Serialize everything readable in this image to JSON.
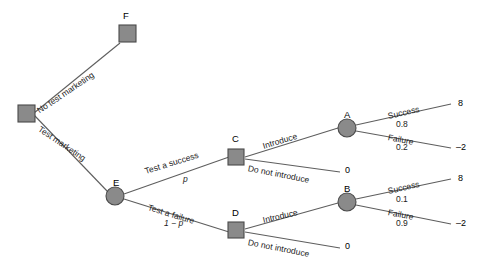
{
  "diagram": {
    "colors": {
      "node_fill": "#8a8a8a",
      "node_stroke": "#4a4a4a",
      "line": "#5e5e5e",
      "text": "#1c1c1c",
      "background": "#ffffff"
    },
    "nodes": [
      {
        "id": "root",
        "label": "",
        "shape": "square"
      },
      {
        "id": "F",
        "label": "F",
        "shape": "square"
      },
      {
        "id": "E",
        "label": "E",
        "shape": "circle"
      },
      {
        "id": "C",
        "label": "C",
        "shape": "square"
      },
      {
        "id": "D",
        "label": "D",
        "shape": "square"
      },
      {
        "id": "A",
        "label": "A",
        "shape": "circle"
      },
      {
        "id": "B",
        "label": "B",
        "shape": "circle"
      }
    ],
    "branches": [
      {
        "id": "no-test-marketing",
        "label": "No test marketing",
        "probability": ""
      },
      {
        "id": "test-marketing",
        "label": "Test marketing",
        "probability": ""
      },
      {
        "id": "test-a-success",
        "label": "Test a success",
        "probability": "p"
      },
      {
        "id": "test-a-failure",
        "label": "Test a failure",
        "probability": "1 − p"
      },
      {
        "id": "introduce-c",
        "label": "Introduce",
        "probability": ""
      },
      {
        "id": "do-not-introduce-c",
        "label": "Do not introduce",
        "probability": ""
      },
      {
        "id": "introduce-d",
        "label": "Introduce",
        "probability": ""
      },
      {
        "id": "do-not-introduce-d",
        "label": "Do not introduce",
        "probability": ""
      },
      {
        "id": "success-a",
        "label": "Success",
        "probability": "0.8"
      },
      {
        "id": "failure-a",
        "label": "Failure",
        "probability": "0.2"
      },
      {
        "id": "success-b",
        "label": "Success",
        "probability": "0.1"
      },
      {
        "id": "failure-b",
        "label": "Failure",
        "probability": "0.9"
      }
    ],
    "payoffs": [
      {
        "id": "payoff-a-success",
        "value": "8"
      },
      {
        "id": "payoff-a-failure",
        "value": "–2"
      },
      {
        "id": "payoff-b-success",
        "value": "8"
      },
      {
        "id": "payoff-b-failure",
        "value": "–2"
      },
      {
        "id": "payoff-c-no-introduce",
        "value": "0"
      },
      {
        "id": "payoff-d-no-introduce",
        "value": "0"
      }
    ]
  }
}
